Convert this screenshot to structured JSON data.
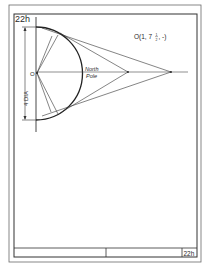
{
  "sheet": {
    "sheet_number_top": "22h",
    "sheet_number_title_block": "22h",
    "point_label": "O(1, 7",
    "point_label_fraction_num": "1",
    "point_label_fraction_den": "2",
    "point_label_tail": ", -)",
    "north_label": "North",
    "pole_label": "Pole",
    "origin_label": "O",
    "dimension_label": "4 DIA"
  },
  "colors": {
    "ink": "#2a2a2a",
    "paper": "#ffffff",
    "border": "#555555"
  }
}
